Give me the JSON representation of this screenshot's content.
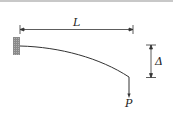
{
  "diagram": {
    "type": "cantilever-beam-deflection",
    "labels": {
      "length": "L",
      "deflection": "Δ",
      "load": "P"
    },
    "colors": {
      "line": "#333333",
      "wall": "#999999"
    }
  }
}
